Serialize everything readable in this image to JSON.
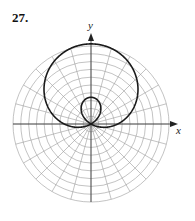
{
  "exercise": {
    "number": "27."
  },
  "chart_data": {
    "type": "polar",
    "title": "",
    "curve": "limacon with inner loop (r = a + b sin θ, b = 2a)",
    "equation_shape": "r = 1 + 2 sin(theta)",
    "xlabel": "x",
    "ylabel": "y",
    "grid": {
      "rings": 10,
      "spokes": 24,
      "spoke_step_deg": 15
    },
    "colors": {
      "curve": "#1a1a1a",
      "grid": "#9a9a9a",
      "axis": "#333333"
    }
  }
}
